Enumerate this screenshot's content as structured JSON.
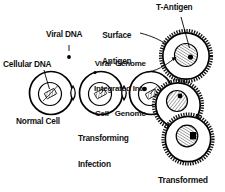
{
  "figure": {
    "background_color": "#ffffff",
    "ink_color": "#000000"
  },
  "labels": {
    "cellular_dna": "Cellular DNA",
    "viral_dna": "Viral DNA",
    "surface_antigen_line1": "Surface",
    "surface_antigen_line2": "Antigen",
    "t_antigen": "T-Antigen",
    "integrated_line1": "Viral  Genome",
    "integrated_line2": "Integrated Into",
    "integrated_line3": "Cell   Genome",
    "normal_cell": "Normal Cell",
    "transforming_line1": "Transforming",
    "transforming_line2": "Infection",
    "transformed_line1": "Transformed",
    "transformed_line2": "Cells"
  },
  "diagram_elements": {
    "cells": [
      {
        "name": "normal-cell",
        "stage": 1,
        "membrane": "smooth",
        "nucleus": "hatched-chromosome",
        "viral_dot": false
      },
      {
        "name": "infected-cell",
        "stage": 2,
        "membrane": "smooth",
        "nucleus": "hatched-chromosome",
        "viral_dot": false
      },
      {
        "name": "integrated-genome-cell",
        "stage": 3,
        "membrane": "smooth",
        "nucleus": "hatched-chromosome",
        "viral_dot": true
      },
      {
        "name": "transformed-cell-top",
        "stage": 4,
        "membrane": "spiky",
        "nucleus": "hatched-chromosome",
        "viral_dot": true
      },
      {
        "name": "transformed-cell-middle",
        "stage": 4,
        "membrane": "spiky",
        "nucleus": "hatched-chromosome",
        "viral_dot": true
      },
      {
        "name": "transformed-cell-bottom",
        "stage": 4,
        "membrane": "spiky",
        "nucleus": "hatched-chromosome",
        "viral_dot": true
      }
    ],
    "free_viral_dna_particle": {
      "name": "viral-dna-dot",
      "shape": "filled-dot"
    },
    "connectors": [
      "lens-arrow-1",
      "lens-arrow-2",
      "lens-arrow-3"
    ]
  }
}
